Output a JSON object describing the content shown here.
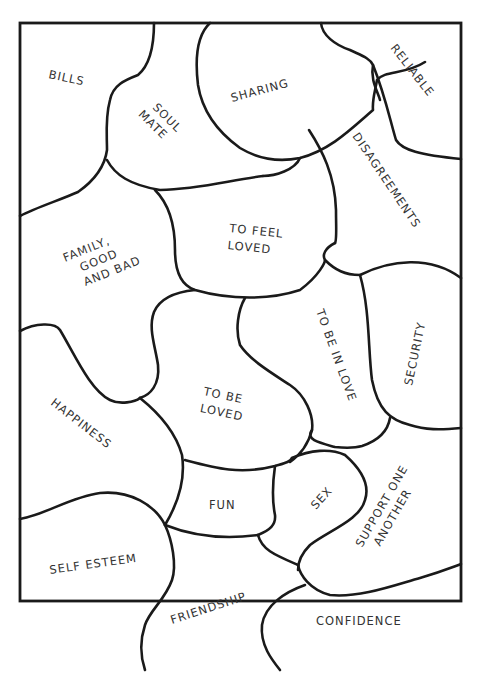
{
  "colors": {
    "background": "#ffffff",
    "line": "#1a1a1a",
    "text": "#333333"
  },
  "pieces": [
    {
      "id": "bills",
      "lines": [
        "BILLS"
      ]
    },
    {
      "id": "soul-mate",
      "lines": [
        "SOUL",
        "MATE"
      ]
    },
    {
      "id": "sharing",
      "lines": [
        "SHARING"
      ]
    },
    {
      "id": "reliable",
      "lines": [
        "RELIABLE"
      ]
    },
    {
      "id": "disagreements",
      "lines": [
        "DISAGREEMENTS"
      ]
    },
    {
      "id": "to-feel-loved",
      "lines": [
        "TO FEEL",
        "LOVED"
      ]
    },
    {
      "id": "family-good-and-bad",
      "lines": [
        "FAMILY,",
        "GOOD",
        "AND BAD"
      ]
    },
    {
      "id": "to-be-in-love",
      "lines": [
        "TO BE IN LOVE"
      ]
    },
    {
      "id": "security",
      "lines": [
        "SECURITY"
      ]
    },
    {
      "id": "to-be-loved",
      "lines": [
        "TO BE",
        "LOVED"
      ]
    },
    {
      "id": "happiness",
      "lines": [
        "HAPPINESS"
      ]
    },
    {
      "id": "fun",
      "lines": [
        "FUN"
      ]
    },
    {
      "id": "sex",
      "lines": [
        "SEX"
      ]
    },
    {
      "id": "support-one-another",
      "lines": [
        "SUPPORT ONE",
        "ANOTHER"
      ]
    },
    {
      "id": "self-esteem",
      "lines": [
        "SELF ESTEEM"
      ]
    },
    {
      "id": "friendship",
      "lines": [
        "FRIENDSHIP"
      ]
    },
    {
      "id": "confidence",
      "lines": [
        "CONFIDENCE"
      ]
    }
  ]
}
